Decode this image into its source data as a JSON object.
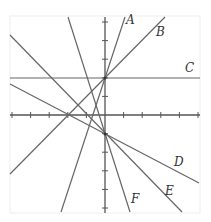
{
  "diagram": {
    "type": "coordinate-plane-lines",
    "frame": {
      "x": 10,
      "y": 16,
      "width": 190,
      "height": 197,
      "stroke": "#eeeeee"
    },
    "axes": {
      "origin": [
        105,
        115
      ],
      "tick_spacing": 18.6,
      "x_axis": {
        "x1": 10,
        "x2": 200,
        "y": 115,
        "ticks_left": 5,
        "ticks_right": 5
      },
      "y_axis": {
        "x": 105,
        "y1": 17,
        "y2": 213,
        "ticks_up": 5,
        "ticks_down": 5
      },
      "color": "#555555"
    },
    "line_color": "#666666",
    "lines": [
      {
        "name": "A",
        "x1": 61,
        "y1": 212,
        "x2": 125,
        "y2": 17,
        "label": "A",
        "label_x": 126,
        "label_y": 24
      },
      {
        "name": "B",
        "x1": 10,
        "y1": 174,
        "x2": 165,
        "y2": 17,
        "label": "B",
        "label_x": 156,
        "label_y": 36
      },
      {
        "name": "C",
        "x1": 10,
        "y1": 78,
        "x2": 200,
        "y2": 78,
        "label": "C",
        "label_x": 185,
        "label_y": 72
      },
      {
        "name": "D",
        "x1": 10,
        "y1": 84,
        "x2": 199,
        "y2": 183,
        "label": "D",
        "label_x": 174,
        "label_y": 166
      },
      {
        "name": "E",
        "x1": 10,
        "y1": 35,
        "x2": 182,
        "y2": 212,
        "label": "E",
        "label_x": 165,
        "label_y": 195
      },
      {
        "name": "F",
        "x1": 68,
        "y1": 17,
        "x2": 130,
        "y2": 212,
        "label": "F",
        "label_x": 131,
        "label_y": 203
      }
    ],
    "points": [
      {
        "name": "AB-C intersection",
        "x": 105,
        "y": 78
      },
      {
        "name": "DEF intersection",
        "x": 105,
        "y": 134
      }
    ]
  }
}
